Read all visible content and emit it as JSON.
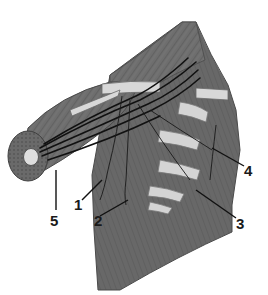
{
  "figure": {
    "colors": {
      "background": "#ffffff",
      "muscle": "#6e6e6e",
      "muscle_dark": "#555555",
      "muscle_light": "#8a8a8a",
      "bone": "#d4d4d4",
      "nerve": "#111111",
      "label": "#1a1a1a"
    },
    "labels": [
      {
        "id": "1",
        "text": "1",
        "x": 74,
        "y": 197
      },
      {
        "id": "2",
        "text": "2",
        "x": 94,
        "y": 213
      },
      {
        "id": "3",
        "text": "3",
        "x": 236,
        "y": 216
      },
      {
        "id": "4",
        "text": "4",
        "x": 244,
        "y": 163
      },
      {
        "id": "5",
        "text": "5",
        "x": 50,
        "y": 213
      }
    ]
  }
}
